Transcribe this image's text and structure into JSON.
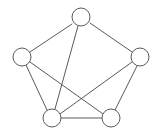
{
  "figure": {
    "canvas": {
      "width": 161,
      "height": 138
    },
    "style": {
      "background_color": "#ffffff",
      "edge_color": "#5a5a5a",
      "node_stroke_color": "#5a5a5a",
      "node_fill_color": "#ffffff",
      "edge_width": 1,
      "node_stroke_width": 1,
      "node_radius": 9
    }
  },
  "graph": {
    "node_count": 5,
    "edge_count": 8,
    "nodes": [
      {
        "id": "top",
        "label": "",
        "cx": 81,
        "cy": 17,
        "r": 9
      },
      {
        "id": "left",
        "label": "",
        "cx": 22,
        "cy": 57,
        "r": 9
      },
      {
        "id": "right",
        "label": "",
        "cx": 140,
        "cy": 57,
        "r": 9
      },
      {
        "id": "bottom-left",
        "label": "",
        "cx": 52,
        "cy": 118,
        "r": 9
      },
      {
        "id": "bottom-right",
        "label": "",
        "cx": 111,
        "cy": 118,
        "r": 9
      }
    ],
    "edges": [
      {
        "id": "edge-top-left",
        "from": "top",
        "to": "left",
        "x1": 72,
        "y1": 24,
        "x2": 30,
        "y2": 52
      },
      {
        "id": "edge-top-right",
        "from": "top",
        "to": "right",
        "x1": 90,
        "y1": 23,
        "x2": 132,
        "y2": 52
      },
      {
        "id": "edge-top-bottom-left",
        "from": "top",
        "to": "bottom-left",
        "x1": 78,
        "y1": 26,
        "x2": 55,
        "y2": 109
      },
      {
        "id": "edge-left-bottom-left",
        "from": "left",
        "to": "bottom-left",
        "x1": 26,
        "y1": 65,
        "x2": 47,
        "y2": 110
      },
      {
        "id": "edge-left-bottom-right",
        "from": "left",
        "to": "bottom-right",
        "x1": 30,
        "y1": 62,
        "x2": 103,
        "y2": 114
      },
      {
        "id": "edge-right-bottom-left",
        "from": "right",
        "to": "bottom-left",
        "x1": 132,
        "y1": 62,
        "x2": 60,
        "y2": 114
      },
      {
        "id": "edge-right-bottom-right",
        "from": "right",
        "to": "bottom-right",
        "x1": 137,
        "y1": 66,
        "x2": 115,
        "y2": 110
      },
      {
        "id": "edge-bottom-left-bottom-right",
        "from": "bottom-left",
        "to": "bottom-right",
        "x1": 61,
        "y1": 118,
        "x2": 102,
        "y2": 118
      }
    ]
  }
}
